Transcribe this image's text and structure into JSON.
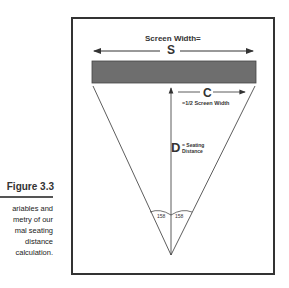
{
  "diagram": {
    "screen_width_label": "Screen Width=",
    "screen_symbol": "S",
    "half_symbol": "C",
    "half_label": "=1/2 Screen Width",
    "distance_symbol": "D",
    "distance_label_line1": "= Seating",
    "distance_label_line2": "Distance",
    "left_angle": "158",
    "right_angle": "158",
    "colors": {
      "screen_fill": "#6e6e6e",
      "line": "#333333"
    }
  },
  "figure": {
    "title": "Figure 3.3",
    "caption_lines": [
      "ariables and",
      "metry of our",
      "mal seating",
      "distance",
      "calculation."
    ]
  }
}
